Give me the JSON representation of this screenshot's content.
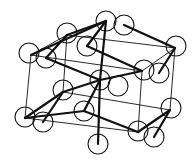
{
  "diagram": {
    "title": "",
    "type": "crystal-lattice-unit-cell",
    "stroke_color": "#111111",
    "fill_color": "#ffffff",
    "atom_radius": 10,
    "atoms": [
      {
        "id": "a1",
        "x": 106,
        "y": 21
      },
      {
        "id": "a2",
        "x": 124,
        "y": 25
      },
      {
        "id": "a3",
        "x": 67,
        "y": 33
      },
      {
        "id": "a4",
        "x": 87,
        "y": 46
      },
      {
        "id": "a5",
        "x": 29,
        "y": 53
      },
      {
        "id": "a6",
        "x": 46,
        "y": 58
      },
      {
        "id": "a7",
        "x": 176,
        "y": 46
      },
      {
        "id": "a8",
        "x": 144,
        "y": 70
      },
      {
        "id": "a9",
        "x": 159,
        "y": 73
      },
      {
        "id": "a10",
        "x": 100,
        "y": 80
      },
      {
        "id": "a11",
        "x": 118,
        "y": 86
      },
      {
        "id": "a12",
        "x": 63,
        "y": 90
      },
      {
        "id": "a13",
        "x": 171,
        "y": 108
      },
      {
        "id": "a14",
        "x": 84,
        "y": 111
      },
      {
        "id": "a15",
        "x": 25,
        "y": 117
      },
      {
        "id": "a16",
        "x": 43,
        "y": 122
      },
      {
        "id": "a17",
        "x": 138,
        "y": 131
      },
      {
        "id": "a18",
        "x": 154,
        "y": 137
      },
      {
        "id": "a19",
        "x": 98,
        "y": 144
      }
    ],
    "thin_lines": [
      [
        31,
        55,
        67,
        35
      ],
      [
        67,
        35,
        175,
        48
      ],
      [
        31,
        55,
        142,
        71
      ],
      [
        142,
        71,
        175,
        48
      ],
      [
        25,
        118,
        63,
        92
      ],
      [
        63,
        92,
        170,
        110
      ],
      [
        25,
        118,
        138,
        132
      ],
      [
        138,
        132,
        170,
        110
      ],
      [
        31,
        55,
        25,
        118
      ],
      [
        67,
        35,
        63,
        92
      ],
      [
        175,
        48,
        170,
        110
      ],
      [
        142,
        71,
        138,
        132
      ]
    ],
    "thick_lines": [
      [
        31,
        55,
        106,
        21
      ],
      [
        67,
        35,
        106,
        21
      ],
      [
        106,
        21,
        100,
        80
      ],
      [
        124,
        25,
        175,
        48
      ],
      [
        46,
        58,
        100,
        80
      ],
      [
        100,
        80,
        142,
        71
      ],
      [
        100,
        80,
        63,
        92
      ],
      [
        100,
        80,
        98,
        144
      ],
      [
        87,
        46,
        142,
        71
      ],
      [
        25,
        118,
        84,
        111
      ],
      [
        84,
        111,
        138,
        132
      ],
      [
        63,
        92,
        43,
        122
      ],
      [
        100,
        80,
        84,
        111
      ],
      [
        170,
        110,
        138,
        132
      ],
      [
        170,
        110,
        154,
        137
      ],
      [
        63,
        92,
        25,
        118
      ],
      [
        106,
        21,
        87,
        46
      ],
      [
        175,
        48,
        159,
        73
      ],
      [
        46,
        58,
        67,
        35
      ]
    ]
  }
}
